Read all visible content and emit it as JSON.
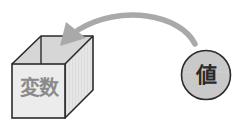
{
  "diagram": {
    "box": {
      "label": "変数",
      "icon": "box-icon",
      "colors": {
        "front": "#ececec",
        "top": "#d6d6d6",
        "right": "#e4e4e4",
        "stroke": "#2b2b2b",
        "text": "#8a8a8a"
      }
    },
    "value": {
      "label": "値",
      "icon": "circle-icon",
      "colors": {
        "fill": "#c9c9c9",
        "stroke": "#2b2b2b",
        "text": "#2a2a2a"
      }
    },
    "arrow": {
      "icon": "curved-arrow-icon",
      "direction": "from value to box",
      "color": "#a9a9a9"
    }
  }
}
